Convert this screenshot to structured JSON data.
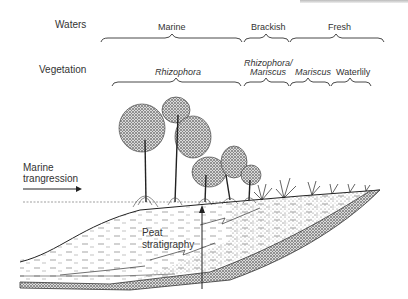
{
  "diagram": {
    "type": "cross-section illustration",
    "rows": {
      "waters": {
        "label": "Waters",
        "zones": [
          "Marine",
          "Brackish",
          "Fresh"
        ]
      },
      "vegetation": {
        "label": "Vegetation",
        "zones": [
          "Rhizophora",
          "Rhizophora/",
          "Mariscus",
          "Mariscus",
          "Waterlily"
        ]
      }
    },
    "annotations": {
      "transgression_line1": "Marine",
      "transgression_line2": "trangression",
      "peat_line1": "Peat",
      "peat_line2": "stratigraphy"
    },
    "colors": {
      "ink": "#222222",
      "background": "#ffffff"
    }
  }
}
